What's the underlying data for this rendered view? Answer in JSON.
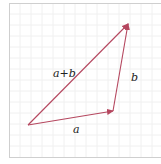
{
  "diagram": {
    "title": "",
    "type": "vector-addition-triangle",
    "colors": {
      "vector": "#b5475f",
      "grid": "#efefef",
      "border": "#cfcfcf",
      "label": "#222222"
    },
    "points": {
      "origin": [
        28,
        125
      ],
      "a_head": [
        113,
        111
      ],
      "sum_head": [
        128,
        24
      ]
    },
    "vectors": [
      {
        "name": "a",
        "from": "origin",
        "to": "a_head",
        "label": "a"
      },
      {
        "name": "b",
        "from": "a_head",
        "to": "sum_head",
        "label": "b"
      },
      {
        "name": "a+b",
        "from": "origin",
        "to": "sum_head",
        "label": "a+b"
      }
    ],
    "labels": {
      "a": "a",
      "b": "b",
      "sum": "a+b"
    }
  }
}
